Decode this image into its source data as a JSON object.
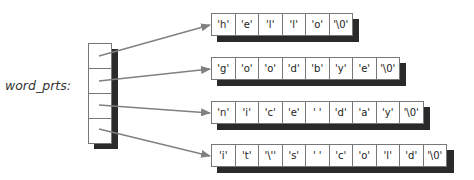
{
  "variable_label": "word_prts:",
  "pointer_array": {
    "cells": 4
  },
  "strings": [
    {
      "chars": [
        "'h'",
        "'e'",
        "'l'",
        "'l'",
        "'o'",
        "'\\0'"
      ]
    },
    {
      "chars": [
        "'g'",
        "'o'",
        "'o'",
        "'d'",
        "'b'",
        "'y'",
        "'e'",
        "'\\0'"
      ]
    },
    {
      "chars": [
        "'n'",
        "'i'",
        "'c'",
        "'e'",
        "' '",
        "'d'",
        "'a'",
        "'y'",
        "'\\0'"
      ]
    },
    {
      "chars": [
        "'i'",
        "'t'",
        "'\\''",
        "'s'",
        "' '",
        "'c'",
        "'o'",
        "'l'",
        "'d'",
        "'\\0'"
      ]
    }
  ],
  "colors": {
    "arrow": "#808080",
    "shadow": "#2a2a2a",
    "border": "#777777"
  }
}
